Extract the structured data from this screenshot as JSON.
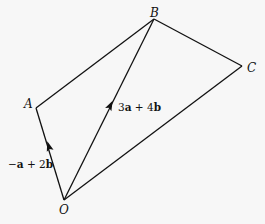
{
  "diagram": {
    "type": "vector-geometry",
    "background": "#f7f7f7",
    "line_color": "#111111",
    "points": {
      "O": {
        "label": "O",
        "x": 64,
        "y": 200
      },
      "A": {
        "label": "A",
        "x": 36,
        "y": 108
      },
      "B": {
        "label": "B",
        "x": 154,
        "y": 19
      },
      "C": {
        "label": "C",
        "x": 242,
        "y": 66
      }
    },
    "segments": [
      {
        "from": "O",
        "to": "A",
        "arrow": true
      },
      {
        "from": "A",
        "to": "B",
        "arrow": false
      },
      {
        "from": "B",
        "to": "C",
        "arrow": false
      },
      {
        "from": "C",
        "to": "O",
        "arrow": false
      },
      {
        "from": "O",
        "to": "B",
        "arrow": true
      }
    ],
    "vector_labels": {
      "OA": {
        "prefix": "−",
        "a": "a",
        "mid": " + 2",
        "b": "b",
        "full": "−a + 2b"
      },
      "OB": {
        "prefix": "3",
        "a": "a",
        "mid": " + 4",
        "b": "b",
        "full": "3a + 4b"
      }
    }
  }
}
